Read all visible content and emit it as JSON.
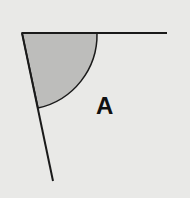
{
  "diagram": {
    "type": "angle",
    "label": "A",
    "colors": {
      "background": "#e9e9e7",
      "line": "#1a1a1a",
      "fill": "#bdbdbb"
    },
    "vertex": [
      22,
      33
    ],
    "ray_top_end": [
      167,
      33
    ],
    "ray_bottom_end": [
      53,
      181
    ]
  }
}
